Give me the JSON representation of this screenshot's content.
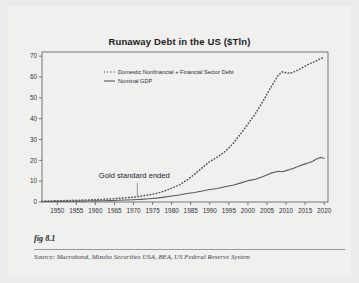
{
  "figure": {
    "number_label": "fig 8.1",
    "source_text": "Source:  Macrobond, Mizuho Securities USA, BEA, US Federal Reserve System",
    "background_color": "#f0f0ef",
    "page_color": "#ebebeb"
  },
  "chart_data": {
    "type": "line",
    "title": "Runaway Debt in the US ($Tln)",
    "xlabel": "",
    "ylabel": "",
    "xlim": [
      1946,
      2021
    ],
    "ylim": [
      0,
      72
    ],
    "yticks": [
      0,
      10,
      20,
      30,
      40,
      50,
      60,
      70
    ],
    "xticks": [
      1950,
      1955,
      1960,
      1965,
      1970,
      1975,
      1980,
      1985,
      1990,
      1995,
      2000,
      2005,
      2010,
      2015,
      2020
    ],
    "grid": false,
    "legend_position": "top-left-inside",
    "x": [
      1946,
      1948,
      1950,
      1952,
      1954,
      1956,
      1958,
      1960,
      1962,
      1964,
      1966,
      1968,
      1970,
      1971,
      1972,
      1974,
      1976,
      1978,
      1980,
      1982,
      1984,
      1986,
      1988,
      1990,
      1992,
      1994,
      1996,
      1998,
      2000,
      2002,
      2004,
      2006,
      2008,
      2009,
      2010,
      2011,
      2012,
      2013,
      2014,
      2015,
      2016,
      2017,
      2018,
      2019,
      2020
    ],
    "series": [
      {
        "name": "Domestic Nonfinancial + Financial Sector Debt",
        "style": "dotted",
        "color": "#4d4d55",
        "values": [
          0.4,
          0.5,
          0.6,
          0.7,
          0.8,
          0.9,
          1.0,
          1.1,
          1.3,
          1.5,
          1.7,
          2.0,
          2.3,
          2.5,
          2.8,
          3.4,
          4.1,
          5.2,
          6.6,
          8.2,
          10.5,
          13.3,
          16.4,
          19.4,
          21.6,
          24.2,
          27.8,
          32.5,
          37.4,
          42.5,
          48.5,
          55.0,
          61.0,
          62.5,
          62.0,
          61.8,
          62.4,
          63.2,
          64.2,
          65.2,
          66.2,
          67.0,
          67.8,
          68.8,
          69.3
        ]
      },
      {
        "name": "Nominal GDP",
        "style": "solid",
        "color": "#5a5a62",
        "values": [
          0.23,
          0.27,
          0.3,
          0.36,
          0.39,
          0.44,
          0.47,
          0.54,
          0.6,
          0.68,
          0.81,
          0.94,
          1.07,
          1.17,
          1.28,
          1.55,
          1.87,
          2.36,
          2.86,
          3.34,
          4.04,
          4.58,
          5.25,
          5.98,
          6.52,
          7.31,
          8.07,
          9.06,
          10.25,
          10.94,
          12.27,
          13.86,
          14.77,
          14.48,
          15.05,
          15.6,
          16.25,
          16.88,
          17.61,
          18.3,
          18.8,
          19.6,
          20.6,
          21.4,
          21.0
        ]
      }
    ],
    "annotations": [
      {
        "text": "Gold standard ended",
        "x": 1971,
        "marker": "vertical-tick"
      }
    ]
  }
}
